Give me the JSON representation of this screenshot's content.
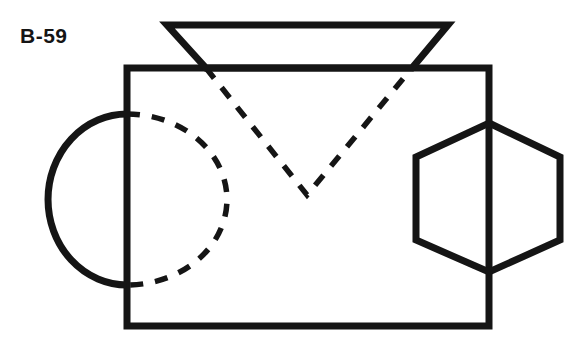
{
  "figure": {
    "label": "B-59",
    "domain": "engineering-orthographic-projection",
    "background_color": "#ffffff",
    "stroke_color": "#151515",
    "solid_stroke_width": 7,
    "hidden_stroke_width": 5.5,
    "hidden_dash_pattern": "13 12",
    "canvas": {
      "width": 582,
      "height": 349
    }
  },
  "shapes": {
    "main_rectangle": {
      "name": "main-body-rectangle",
      "line_style": "solid",
      "x": 127,
      "y": 68,
      "width": 362,
      "height": 258,
      "points": "127,68 489,68 489,326 127,326"
    },
    "top_trapezoid": {
      "name": "top-trapezoid",
      "line_style": "solid",
      "description": "Trapezoid above the rectangle, wider at the top edge",
      "top_left_x": 167,
      "top_right_x": 448,
      "top_y": 25,
      "base_left_x": 206,
      "base_right_x": 412,
      "base_y": 68,
      "points": "167,25 448,25 412,68 206,68"
    },
    "left_semicircle": {
      "name": "left-semicircle",
      "line_style": "solid",
      "description": "Half circle bulging left of the rectangle left edge",
      "edge_x": 127,
      "top_y": 114,
      "bottom_y": 285,
      "leftmost_x": 48,
      "radius_x": 79,
      "radius_y": 85.5,
      "path": "M 127,114 A 79 85.5 0 0 0 127,285"
    },
    "hidden_arc": {
      "name": "hidden-arc",
      "line_style": "hidden-dashed",
      "description": "Dashed mirror arc inside the rectangle completing the cylinder",
      "edge_x": 127,
      "top_y": 114,
      "bottom_y": 285,
      "rightmost_x": 227,
      "radius_x": 100,
      "radius_y": 85.5,
      "path": "M 127,114 A 100 85.5 0 0 1 127,285"
    },
    "hidden_vee": {
      "name": "hidden-vee",
      "line_style": "hidden-dashed",
      "description": "Dashed V from the trapezoid base corners down to a centre vertex",
      "left_start_x": 206,
      "left_start_y": 68,
      "right_start_x": 412,
      "right_start_y": 68,
      "vertex_x": 307,
      "vertex_y": 195,
      "path": "M 206,68 L 307,195 L 412,68"
    },
    "right_hexagon": {
      "name": "right-hexagon",
      "line_style": "solid",
      "description": "Regular hexagon straddling the rectangle right edge, point-up orientation",
      "center_x": 489,
      "center_y": 197.5,
      "top_vertex_y": 123,
      "bottom_vertex_y": 272,
      "left_x": 416,
      "right_x": 560,
      "shoulder_top_y": 157,
      "shoulder_bottom_y": 240,
      "points": "489,123 560,157 560,240 489,272 416,240 416,157"
    },
    "hexagon_centerline": {
      "name": "hexagon-centerline",
      "line_style": "hidden-dashed",
      "description": "Vertical dashed centre line through the hexagon",
      "x": 489,
      "top_y": 123,
      "bottom_y": 272,
      "path": "M 489,123 L 489,272"
    }
  }
}
